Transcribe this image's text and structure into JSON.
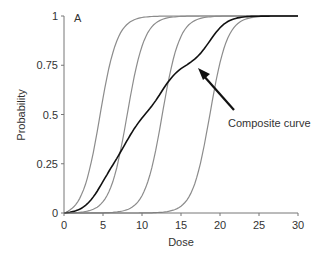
{
  "chart_data": {
    "type": "line",
    "title": "",
    "panel_label": "A",
    "xlabel": "Dose",
    "ylabel": "Probability",
    "xlim": [
      0,
      30
    ],
    "ylim": [
      0,
      1
    ],
    "x_ticks": [
      "0",
      "5",
      "10",
      "15",
      "20",
      "25",
      "30"
    ],
    "y_ticks": [
      "0",
      "0.25",
      "0.5",
      "0.75",
      "1"
    ],
    "grid": false,
    "series": [
      {
        "name": "Individual curve 1",
        "color": "#8c8c8c",
        "midpoint": 4.6,
        "slope": 0.9
      },
      {
        "name": "Individual curve 2",
        "color": "#8c8c8c",
        "midpoint": 8.1,
        "slope": 0.9
      },
      {
        "name": "Individual curve 3",
        "color": "#8c8c8c",
        "midpoint": 12.6,
        "slope": 0.9
      },
      {
        "name": "Individual curve 4",
        "color": "#8c8c8c",
        "midpoint": 18.7,
        "slope": 0.9
      },
      {
        "name": "Composite curve",
        "color": "#111111",
        "midpoint": 10.4
      }
    ],
    "annotation": {
      "text": "Composite curve",
      "arrow_to_dose": 14,
      "arrow_to_prob": 0.72
    }
  }
}
